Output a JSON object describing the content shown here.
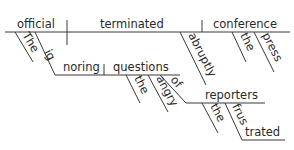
{
  "diagram": {
    "type": "reed-kellogg-sentence-diagram",
    "sentence_words": {
      "subject": "official",
      "subject_article": "The",
      "subject_modifier_gerund": "ignoring",
      "gerund_object": "questions",
      "gerund_object_modifiers": [
        "the",
        "angry"
      ],
      "preposition": "of",
      "prepositional_object": "reporters",
      "prep_object_modifiers": [
        "the",
        "frustrated"
      ],
      "frustrated_part1": "frus",
      "frustrated_part2": "trated",
      "ignoring_part1": "ig",
      "ignoring_part2": "noring",
      "verb": "terminated",
      "adverb": "abruptly",
      "direct_object": "conference",
      "direct_object_modifiers": [
        "the",
        "press"
      ]
    },
    "line_color": "#3a3a3a",
    "text_color": "#2a2a2a",
    "background": "#ffffff"
  }
}
